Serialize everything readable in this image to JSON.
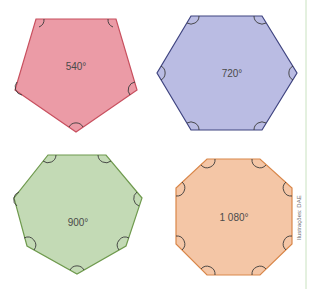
{
  "figure": {
    "polygons": [
      {
        "name": "pentagon",
        "sides": 5,
        "label": "540°",
        "fill": "#e88a96",
        "stroke": "#c8505f"
      },
      {
        "name": "hexagon",
        "sides": 6,
        "label": "720°",
        "fill": "#b3b5e0",
        "stroke": "#3f4480"
      },
      {
        "name": "heptagon",
        "sides": 7,
        "label": "900°",
        "fill": "#bcd6ad",
        "stroke": "#6f9a4e"
      },
      {
        "name": "octagon",
        "sides": 8,
        "label": "1 080°",
        "fill": "#f3c09c",
        "stroke": "#d9874a"
      }
    ],
    "credit": "Ilustrações: DAE",
    "side_rule_color": "#c9e2c0"
  }
}
